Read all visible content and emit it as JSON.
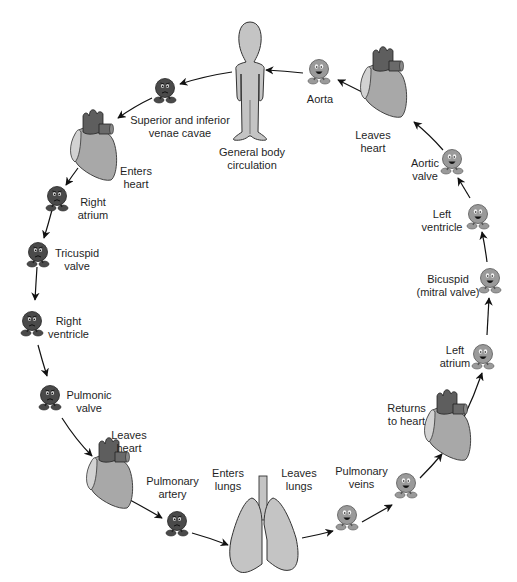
{
  "diagram": {
    "colors": {
      "deoxygenated_cell": "#4a4a4a",
      "oxygenated_cell": "#9a9a9a",
      "heart_body": "#a8a8a8",
      "heart_vessels": "#5e5e5e",
      "heart_light": "#cfcfcf",
      "body_fill": "#c4c4c4",
      "lungs_fill": "#c4c4c4",
      "arrow": "#111111"
    },
    "nodes": {
      "general_body": {
        "line1": "General body",
        "line2": "circulation",
        "icon": "human-body"
      },
      "venae_cavae": {
        "line1": "Superior and inferior",
        "line2": "venae cavae",
        "icon": "deoxygenated-blood-cell"
      },
      "enters_heart": {
        "line1": "Enters",
        "line2": "heart",
        "icon": "heart"
      },
      "right_atrium": {
        "line1": "Right",
        "line2": "atrium",
        "icon": "deoxygenated-blood-cell"
      },
      "tricuspid_valve": {
        "line1": "Tricuspid",
        "line2": "valve",
        "icon": "deoxygenated-blood-cell"
      },
      "right_ventricle": {
        "line1": "Right",
        "line2": "ventricle",
        "icon": "deoxygenated-blood-cell"
      },
      "pulmonic_valve": {
        "line1": "Pulmonic",
        "line2": "valve",
        "icon": "deoxygenated-blood-cell"
      },
      "leaves_heart_right": {
        "line1": "Leaves",
        "line2": "heart",
        "icon": "heart"
      },
      "pulmonary_artery": {
        "line1": "Pulmonary",
        "line2": "artery",
        "icon": "deoxygenated-blood-cell"
      },
      "enters_lungs": {
        "line1": "Enters",
        "line2": "lungs",
        "icon": "lungs"
      },
      "leaves_lungs": {
        "line1": "Leaves",
        "line2": "lungs",
        "icon": "lungs"
      },
      "pulmonary_veins": {
        "line1": "Pulmonary",
        "line2": "veins",
        "icon": "oxygenated-blood-cell"
      },
      "returns_to_heart": {
        "line1": "Returns",
        "line2": "to heart",
        "icon": "heart"
      },
      "left_atrium": {
        "line1": "Left",
        "line2": "atrium",
        "icon": "oxygenated-blood-cell"
      },
      "bicuspid": {
        "line1": "Bicuspid",
        "line2": "(mitral valve)",
        "icon": "oxygenated-blood-cell"
      },
      "left_ventricle": {
        "line1": "Left",
        "line2": "ventricle",
        "icon": "oxygenated-blood-cell"
      },
      "aortic_valve": {
        "line1": "Aortic",
        "line2": "valve",
        "icon": "oxygenated-blood-cell"
      },
      "leaves_heart_left": {
        "line1": "Leaves",
        "line2": "heart",
        "icon": "heart"
      },
      "aorta": {
        "line1": "Aorta",
        "icon": "oxygenated-blood-cell"
      }
    }
  }
}
